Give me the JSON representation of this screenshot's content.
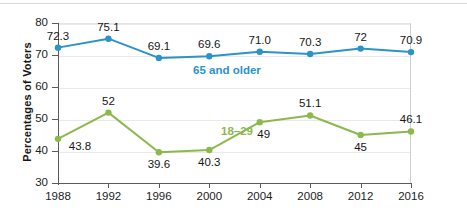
{
  "chart_data": {
    "type": "line",
    "title": "",
    "xlabel": "",
    "ylabel": "Percentages of Voters",
    "x": [
      1988,
      1992,
      1996,
      2000,
      2004,
      2008,
      2012,
      2016
    ],
    "xtick_labels": [
      "1988",
      "1992",
      "1996",
      "2000",
      "2004",
      "2008",
      "2012",
      "2016"
    ],
    "ytick_labels": [
      "80",
      "70",
      "60",
      "50",
      "40",
      "30"
    ],
    "ylim": [
      30,
      80
    ],
    "yticks": [
      30,
      40,
      50,
      60,
      70,
      80
    ],
    "grid": "horizontal",
    "legend": "inline-series-labels",
    "series": [
      {
        "name": "65 and older",
        "color": "#2b93c9",
        "values": [
          72.3,
          75.1,
          69.1,
          69.6,
          71.0,
          70.3,
          72,
          70.9
        ],
        "value_labels": [
          "72.3",
          "75.1",
          "69.1",
          "69.6",
          "71.0",
          "70.3",
          "72",
          "70.9"
        ],
        "label_positions": [
          "above",
          "above",
          "above",
          "above",
          "above",
          "above",
          "above",
          "above"
        ],
        "inline_label": "65 and older",
        "inline_label_x": 2001.4,
        "inline_label_y": 65.0
      },
      {
        "name": "18–29",
        "color": "#8cb84c",
        "values": [
          43.8,
          52,
          39.6,
          40.3,
          49,
          51.1,
          45,
          46.1
        ],
        "value_labels": [
          "43.8",
          "52",
          "39.6",
          "40.3",
          "49",
          "51.1",
          "45",
          "46.1"
        ],
        "label_positions": [
          "right-below",
          "above",
          "below",
          "below",
          "below-right",
          "above",
          "below",
          "above"
        ],
        "inline_label": "18–29",
        "inline_label_x": 2002.2,
        "inline_label_y": 45.8
      }
    ]
  }
}
